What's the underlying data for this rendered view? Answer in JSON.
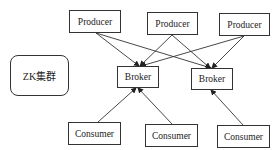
{
  "diagram": {
    "zk": {
      "label": "ZK集群"
    },
    "producers": [
      {
        "label": "Producer",
        "x": 69,
        "y": 10,
        "w": 52,
        "h": 23
      },
      {
        "label": "Producer",
        "x": 147,
        "y": 12,
        "w": 51,
        "h": 23
      },
      {
        "label": "Producer",
        "x": 219,
        "y": 13,
        "w": 51,
        "h": 23
      }
    ],
    "brokers": [
      {
        "label": "Broker",
        "x": 117,
        "y": 66,
        "w": 42,
        "h": 22
      },
      {
        "label": "Broker",
        "x": 191,
        "y": 68,
        "w": 42,
        "h": 22
      }
    ],
    "consumers": [
      {
        "label": "Consumer",
        "x": 68,
        "y": 122,
        "w": 53,
        "h": 23
      },
      {
        "label": "Consumer",
        "x": 145,
        "y": 124,
        "w": 53,
        "h": 23
      },
      {
        "label": "Consumer",
        "x": 217,
        "y": 125,
        "w": 53,
        "h": 23
      }
    ],
    "edges": [
      {
        "from": "producer-1",
        "to": "broker-1"
      },
      {
        "from": "producer-1",
        "to": "broker-2"
      },
      {
        "from": "producer-2",
        "to": "broker-1"
      },
      {
        "from": "producer-2",
        "to": "broker-2"
      },
      {
        "from": "producer-3",
        "to": "broker-1"
      },
      {
        "from": "producer-3",
        "to": "broker-2"
      },
      {
        "from": "consumer-1",
        "to": "broker-1"
      },
      {
        "from": "consumer-2",
        "to": "broker-1"
      },
      {
        "from": "consumer-3",
        "to": "broker-2"
      }
    ]
  }
}
